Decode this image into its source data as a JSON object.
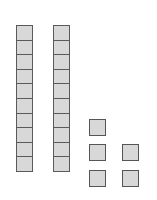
{
  "diagram": {
    "type": "base-ten-blocks",
    "tens_rods": 2,
    "units_per_rod": 10,
    "ones_cubes": 5,
    "ones_columns": [
      3,
      2
    ],
    "represented_value": 25,
    "colors": {
      "fill": "#d8d8d8",
      "stroke": "#555555",
      "background": "#ffffff"
    }
  }
}
